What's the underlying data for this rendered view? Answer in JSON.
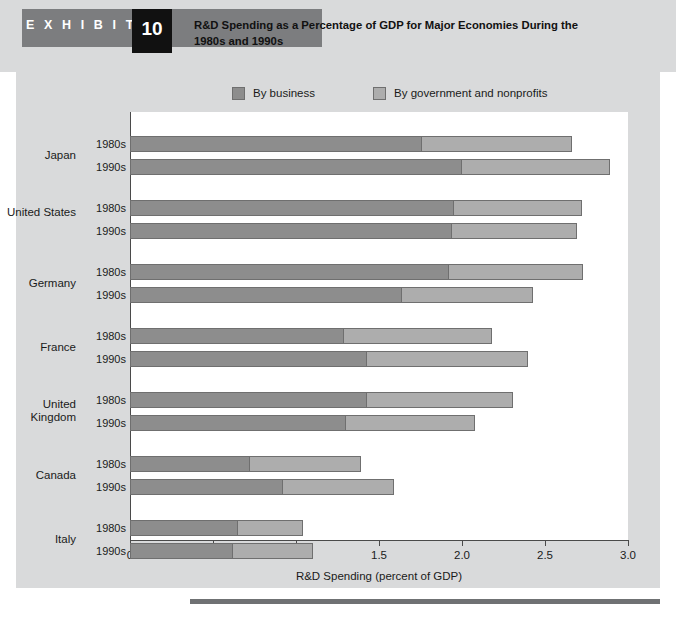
{
  "header": {
    "exhibit_word": "E X H I B I T",
    "exhibit_number": "10",
    "title": "R&D Spending as a Percentage of GDP for Major Economies During the 1980s and 1990s"
  },
  "legend": {
    "items": [
      {
        "label": "By business",
        "color": "#8d8d8d",
        "key": "business"
      },
      {
        "label": "By government and nonprofits",
        "color": "#adadad",
        "key": "government"
      }
    ]
  },
  "chart_data": {
    "type": "bar",
    "orientation": "horizontal",
    "stacked": true,
    "title": "R&D Spending as a Percentage of GDP for Major Economies During the 1980s and 1990s",
    "xlabel": "R&D Spending (percent of GDP)",
    "ylabel": "",
    "xlim": [
      0,
      3.0
    ],
    "xticks": [
      "0",
      "0.5",
      "1.0",
      "1.5",
      "2.0",
      "2.5",
      "3.0"
    ],
    "xtick_values": [
      0,
      0.5,
      1.0,
      1.5,
      2.0,
      2.5,
      3.0
    ],
    "grid": false,
    "legend_position": "top",
    "series": [
      {
        "name": "By business",
        "color": "#8d8d8d"
      },
      {
        "name": "By government and nonprofits",
        "color": "#adadad"
      }
    ],
    "groups": [
      {
        "country": "Japan",
        "rows": [
          {
            "period": "1980s",
            "business": 1.76,
            "government": 0.9,
            "total": 2.66
          },
          {
            "period": "1990s",
            "business": 2.0,
            "government": 0.89,
            "total": 2.89
          }
        ]
      },
      {
        "country": "United States",
        "rows": [
          {
            "period": "1980s",
            "business": 1.95,
            "government": 0.77,
            "total": 2.72
          },
          {
            "period": "1990s",
            "business": 1.94,
            "government": 0.75,
            "total": 2.69
          }
        ]
      },
      {
        "country": "Germany",
        "rows": [
          {
            "period": "1980s",
            "business": 1.92,
            "government": 0.81,
            "total": 2.73
          },
          {
            "period": "1990s",
            "business": 1.64,
            "government": 0.79,
            "total": 2.43
          }
        ]
      },
      {
        "country": "France",
        "rows": [
          {
            "period": "1980s",
            "business": 1.29,
            "government": 0.89,
            "total": 2.18
          },
          {
            "period": "1990s",
            "business": 1.43,
            "government": 0.97,
            "total": 2.4
          }
        ]
      },
      {
        "country": "United Kingdom",
        "rows": [
          {
            "period": "1980s",
            "business": 1.43,
            "government": 0.88,
            "total": 2.31
          },
          {
            "period": "1990s",
            "business": 1.3,
            "government": 0.78,
            "total": 2.08
          }
        ]
      },
      {
        "country": "Canada",
        "rows": [
          {
            "period": "1980s",
            "business": 0.72,
            "government": 0.67,
            "total": 1.39
          },
          {
            "period": "1990s",
            "business": 0.92,
            "government": 0.67,
            "total": 1.59
          }
        ]
      },
      {
        "country": "Italy",
        "rows": [
          {
            "period": "1980s",
            "business": 0.65,
            "government": 0.39,
            "total": 1.04
          },
          {
            "period": "1990s",
            "business": 0.62,
            "government": 0.48,
            "total": 1.1
          }
        ]
      }
    ]
  },
  "colors": {
    "panel_background": "#d9dadb",
    "plot_background": "#ffffff",
    "business": "#8d8d8d",
    "government": "#adadad",
    "bar_stroke": "#6f6f6f",
    "axis": "#4a4a4a",
    "exhibit_tab": "#7c7d7f",
    "exhibit_number_box": "#111111",
    "bottom_rule": "#6f7173"
  }
}
